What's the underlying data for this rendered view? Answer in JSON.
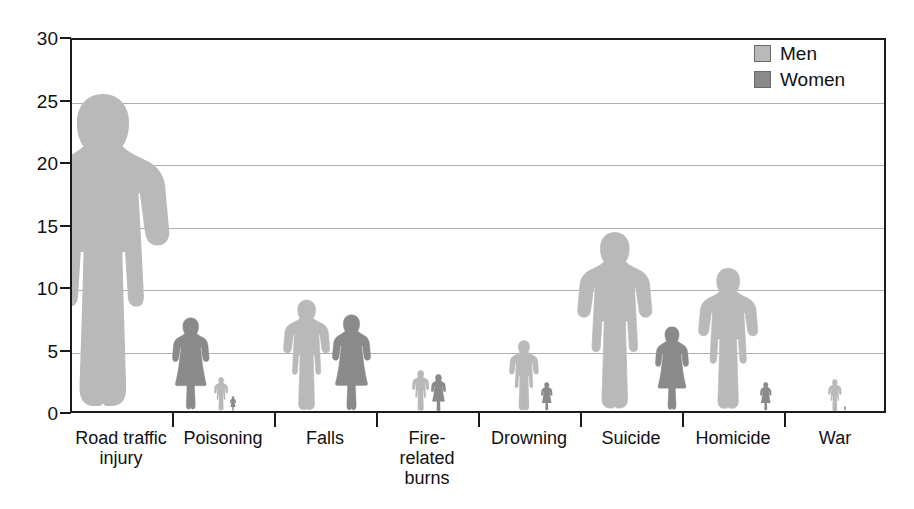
{
  "chart_data": {
    "type": "bar",
    "title": "",
    "subtitle": "",
    "xlabel": "",
    "ylabel": "",
    "grid": true,
    "legend_position": "top-right",
    "ylim": [
      0,
      30
    ],
    "yticks": [
      0,
      5,
      10,
      15,
      20,
      25,
      30
    ],
    "ytick_labels": [
      "0",
      "5",
      "10",
      "15",
      "20",
      "25",
      "30"
    ],
    "categories": [
      "Road traffic injury",
      "Poisoning",
      "Falls",
      "Fire-related burns",
      "Drowning",
      "Suicide",
      "Homicide",
      "War"
    ],
    "category_lines": [
      [
        "Road traffic",
        "injury"
      ],
      [
        "Poisoning"
      ],
      [
        "Falls"
      ],
      [
        "Fire-",
        "related",
        "burns"
      ],
      [
        "Drowning"
      ],
      [
        "Suicide"
      ],
      [
        "Homicide"
      ],
      [
        "War"
      ]
    ],
    "series": [
      {
        "name": "Men",
        "color": "#b9b9b9",
        "values": [
          25.5,
          2.7,
          9.0,
          3.3,
          5.7,
          14.4,
          11.5,
          2.6
        ]
      },
      {
        "name": "Women",
        "color": "#8a8a8a",
        "values": [
          7.5,
          1.2,
          7.8,
          3.0,
          2.3,
          6.8,
          2.3,
          0.4
        ]
      }
    ]
  },
  "legend": {
    "items": [
      {
        "label": "Men",
        "color": "#b9b9b9"
      },
      {
        "label": "Women",
        "color": "#8a8a8a"
      }
    ]
  },
  "colors": {
    "men": "#b9b9b9",
    "women": "#8a8a8a",
    "axis": "#1c1c1c",
    "gridline": "#b0b0b0",
    "text": "#111111",
    "background": "#ffffff"
  }
}
